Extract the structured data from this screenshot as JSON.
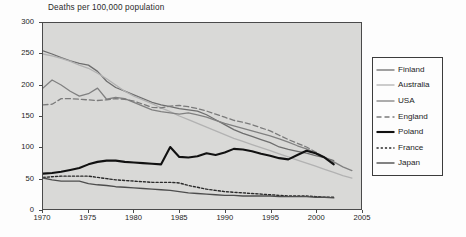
{
  "chart_data": {
    "type": "line",
    "title": "Deaths per 100,000 population",
    "xlabel": "",
    "ylabel": "",
    "xlim": [
      1970,
      2005
    ],
    "ylim": [
      0,
      300
    ],
    "grid": false,
    "legend_position": "right-outside",
    "x_ticks": [
      "1970",
      "1975",
      "1980",
      "1985",
      "1990",
      "1995",
      "2000",
      "2005"
    ],
    "y_ticks": [
      "0",
      "50",
      "100",
      "150",
      "200",
      "250",
      "300"
    ],
    "series": [
      {
        "name": "Finland",
        "color": "#6e6e6e",
        "style": "solid",
        "width": 1.3,
        "x": [
          1970,
          1971,
          1972,
          1973,
          1974,
          1975,
          1976,
          1977,
          1978,
          1979,
          1980,
          1981,
          1982,
          1983,
          1984,
          1985,
          1986,
          1987,
          1988,
          1989,
          1990,
          1991,
          1992,
          1993,
          1994,
          1995,
          1996,
          1997,
          1998,
          1999,
          2000,
          2001,
          2002
        ],
        "y": [
          255,
          250,
          244,
          239,
          235,
          232,
          222,
          206,
          196,
          190,
          184,
          178,
          172,
          168,
          165,
          162,
          160,
          158,
          152,
          144,
          136,
          128,
          122,
          117,
          112,
          107,
          100,
          96,
          93,
          90,
          86,
          83,
          78
        ]
      },
      {
        "name": "Australia",
        "color": "#b2b2b2",
        "style": "solid",
        "width": 1.3,
        "x": [
          1970,
          1971,
          1972,
          1973,
          1974,
          1975,
          1976,
          1977,
          1978,
          1979,
          1980,
          1981,
          1982,
          1983,
          1984,
          1985,
          1986,
          1987,
          1988,
          1989,
          1990,
          1991,
          1992,
          1993,
          1994,
          1995,
          1996,
          1997,
          1998,
          1999,
          2000,
          2001,
          2002,
          2003,
          2004
        ],
        "y": [
          250,
          247,
          243,
          238,
          232,
          227,
          219,
          210,
          200,
          190,
          182,
          176,
          170,
          163,
          157,
          150,
          144,
          138,
          132,
          126,
          120,
          114,
          109,
          104,
          99,
          94,
          89,
          84,
          79,
          74,
          69,
          64,
          59,
          54,
          50
        ]
      },
      {
        "name": "USA",
        "color": "#808080",
        "style": "solid",
        "width": 1.3,
        "x": [
          1970,
          1971,
          1972,
          1973,
          1974,
          1975,
          1976,
          1977,
          1978,
          1979,
          1980,
          1981,
          1982,
          1983,
          1984,
          1985,
          1986,
          1987,
          1988,
          1989,
          1990,
          1991,
          1992,
          1993,
          1994,
          1995,
          1996,
          1997,
          1998,
          1999,
          2000,
          2001,
          2002,
          2003,
          2004
        ],
        "y": [
          195,
          208,
          200,
          190,
          182,
          186,
          195,
          177,
          180,
          178,
          172,
          166,
          160,
          157,
          155,
          153,
          155,
          152,
          148,
          143,
          138,
          134,
          130,
          126,
          122,
          118,
          113,
          108,
          102,
          97,
          90,
          83,
          76,
          68,
          62
        ]
      },
      {
        "name": "England",
        "color": "#7a7a7a",
        "style": "dashed",
        "width": 1.3,
        "x": [
          1970,
          1971,
          1972,
          1973,
          1974,
          1975,
          1976,
          1977,
          1978,
          1979,
          1980,
          1981,
          1982,
          1983,
          1984,
          1985,
          1986,
          1987,
          1988,
          1989,
          1990,
          1991,
          1992,
          1993,
          1994,
          1995,
          1996,
          1997,
          1998,
          1999,
          2000,
          2001,
          2002
        ],
        "y": [
          168,
          169,
          178,
          178,
          177,
          176,
          175,
          176,
          178,
          177,
          174,
          169,
          164,
          163,
          166,
          167,
          165,
          162,
          158,
          153,
          148,
          143,
          140,
          136,
          131,
          126,
          119,
          112,
          106,
          100,
          92,
          83,
          74
        ]
      },
      {
        "name": "Poland",
        "color": "#111111",
        "style": "solid",
        "width": 2.1,
        "x": [
          1970,
          1971,
          1972,
          1973,
          1974,
          1975,
          1976,
          1977,
          1978,
          1979,
          1980,
          1981,
          1982,
          1983,
          1984,
          1985,
          1986,
          1987,
          1988,
          1989,
          1990,
          1991,
          1992,
          1993,
          1994,
          1995,
          1996,
          1997,
          1998,
          1999,
          2000,
          2001,
          2002
        ],
        "y": [
          57,
          58,
          60,
          63,
          66,
          72,
          76,
          78,
          78,
          76,
          75,
          74,
          73,
          72,
          100,
          84,
          83,
          85,
          90,
          87,
          91,
          97,
          96,
          93,
          89,
          86,
          82,
          80,
          87,
          94,
          90,
          83,
          72
        ]
      },
      {
        "name": "France",
        "color": "#2a2a2a",
        "style": "dotted",
        "width": 1.4,
        "x": [
          1970,
          1971,
          1972,
          1973,
          1974,
          1975,
          1976,
          1977,
          1978,
          1979,
          1980,
          1981,
          1982,
          1983,
          1984,
          1985,
          1986,
          1987,
          1988,
          1989,
          1990,
          1991,
          1992,
          1993,
          1994,
          1995,
          1996,
          1997,
          1998,
          1999,
          2000,
          2001,
          2002
        ],
        "y": [
          51,
          52,
          53,
          53,
          53,
          53,
          51,
          49,
          47,
          46,
          45,
          44,
          43,
          43,
          43,
          42,
          38,
          35,
          32,
          30,
          28,
          27,
          26,
          25,
          24,
          23,
          22,
          21,
          21,
          21,
          20,
          19,
          19
        ]
      },
      {
        "name": "Japan",
        "color": "#4d4d4d",
        "style": "solid",
        "width": 1.4,
        "x": [
          1970,
          1971,
          1972,
          1973,
          1974,
          1975,
          1976,
          1977,
          1978,
          1979,
          1980,
          1981,
          1982,
          1983,
          1984,
          1985,
          1986,
          1987,
          1988,
          1989,
          1990,
          1991,
          1992,
          1993,
          1994,
          1995,
          1996,
          1997,
          1998,
          1999,
          2000,
          2001,
          2002
        ],
        "y": [
          50,
          47,
          45,
          45,
          45,
          41,
          39,
          38,
          36,
          35,
          34,
          33,
          32,
          31,
          30,
          28,
          26,
          25,
          24,
          23,
          22,
          22,
          21,
          21,
          21,
          21,
          20,
          20,
          20,
          20,
          19,
          19,
          18
        ]
      }
    ]
  },
  "legend": {
    "entries": [
      {
        "label": "Finland"
      },
      {
        "label": "Australia"
      },
      {
        "label": "USA"
      },
      {
        "label": "England"
      },
      {
        "label": "Poland"
      },
      {
        "label": "France"
      },
      {
        "label": "Japan"
      }
    ]
  }
}
